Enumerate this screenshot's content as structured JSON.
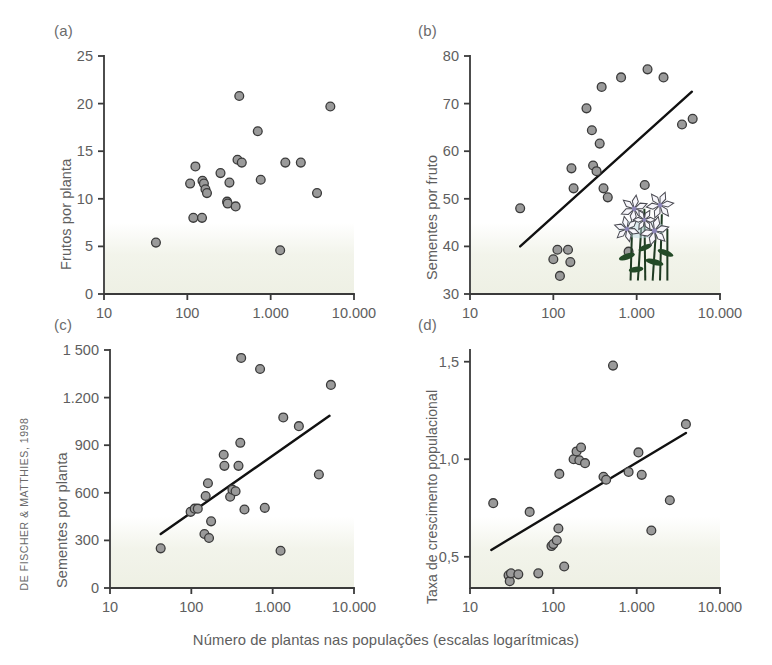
{
  "credit": "DE FISCHER & MATTHIES, 1998",
  "caption": "Número de plantas nas populações (escalas logarítmicas)",
  "shared": {
    "x_ticks": [
      "10",
      "100",
      "1.000",
      "10.000"
    ],
    "x_tick_values": [
      10,
      100,
      1000,
      10000
    ],
    "xscale": "log",
    "xlim": [
      10,
      10000
    ],
    "marker_fill": "#9a9a9a",
    "marker_stroke": "#3a3a3a",
    "axis_color": "#3a3a3a",
    "trend_color": "#111111",
    "shade_color": "#eef0e4"
  },
  "panels": [
    {
      "tag": "(a)",
      "ylabel": "Frutos por planta",
      "chart_data": {
        "type": "scatter",
        "title": "(a)",
        "xlabel": "Número de plantas nas populações (escalas logarítmicas)",
        "ylabel": "Frutos por planta",
        "xscale": "log",
        "xlim": [
          10,
          10000
        ],
        "ylim": [
          0,
          25
        ],
        "yticks": [
          0,
          5,
          10,
          15,
          20,
          25
        ],
        "ytick_labels": [
          "0",
          "5",
          "10",
          "15",
          "20",
          "25"
        ],
        "xticks": [
          10,
          100,
          1000,
          10000
        ],
        "xtick_labels": [
          "10",
          "100",
          "1.000",
          "10.000"
        ],
        "grid": false,
        "legend": null,
        "trendline": null,
        "points": [
          {
            "x": 42,
            "y": 5.4
          },
          {
            "x": 108,
            "y": 11.6
          },
          {
            "x": 118,
            "y": 8.0
          },
          {
            "x": 125,
            "y": 13.4
          },
          {
            "x": 150,
            "y": 8.0
          },
          {
            "x": 152,
            "y": 11.9
          },
          {
            "x": 158,
            "y": 11.6
          },
          {
            "x": 165,
            "y": 11.0
          },
          {
            "x": 172,
            "y": 10.6
          },
          {
            "x": 250,
            "y": 12.7
          },
          {
            "x": 300,
            "y": 9.7
          },
          {
            "x": 305,
            "y": 9.5
          },
          {
            "x": 320,
            "y": 11.7
          },
          {
            "x": 380,
            "y": 9.2
          },
          {
            "x": 400,
            "y": 14.1
          },
          {
            "x": 420,
            "y": 20.8
          },
          {
            "x": 450,
            "y": 13.8
          },
          {
            "x": 700,
            "y": 17.1
          },
          {
            "x": 760,
            "y": 12.0
          },
          {
            "x": 1300,
            "y": 4.6
          },
          {
            "x": 1500,
            "y": 13.8
          },
          {
            "x": 2300,
            "y": 13.8
          },
          {
            "x": 3600,
            "y": 10.6
          },
          {
            "x": 5200,
            "y": 19.7
          }
        ]
      }
    },
    {
      "tag": "(b)",
      "ylabel": "Sementes por fruto",
      "chart_data": {
        "type": "scatter",
        "title": "(b)",
        "xlabel": "Número de plantas nas populações (escalas logarítmicas)",
        "ylabel": "Sementes por fruto",
        "xscale": "log",
        "xlim": [
          10,
          10000
        ],
        "ylim": [
          30,
          80
        ],
        "yticks": [
          30,
          40,
          50,
          60,
          70,
          80
        ],
        "ytick_labels": [
          "30",
          "40",
          "50",
          "60",
          "70",
          "80"
        ],
        "xticks": [
          10,
          100,
          1000,
          10000
        ],
        "xtick_labels": [
          "10",
          "100",
          "1.000",
          "10.000"
        ],
        "grid": false,
        "legend": null,
        "trendline": {
          "x1": 40,
          "y1": 40.0,
          "x2": 4600,
          "y2": 72.5
        },
        "annotation": "flower-illustration",
        "points": [
          {
            "x": 40,
            "y": 48.0
          },
          {
            "x": 100,
            "y": 37.3
          },
          {
            "x": 112,
            "y": 39.3
          },
          {
            "x": 120,
            "y": 33.8
          },
          {
            "x": 150,
            "y": 39.3
          },
          {
            "x": 160,
            "y": 36.7
          },
          {
            "x": 165,
            "y": 56.4
          },
          {
            "x": 175,
            "y": 52.2
          },
          {
            "x": 250,
            "y": 69.0
          },
          {
            "x": 290,
            "y": 64.4
          },
          {
            "x": 300,
            "y": 57.0
          },
          {
            "x": 330,
            "y": 55.8
          },
          {
            "x": 360,
            "y": 61.6
          },
          {
            "x": 380,
            "y": 73.5
          },
          {
            "x": 400,
            "y": 52.2
          },
          {
            "x": 450,
            "y": 50.3
          },
          {
            "x": 650,
            "y": 75.5
          },
          {
            "x": 800,
            "y": 38.9
          },
          {
            "x": 1250,
            "y": 52.9
          },
          {
            "x": 1350,
            "y": 77.2
          },
          {
            "x": 2100,
            "y": 75.5
          },
          {
            "x": 3500,
            "y": 65.6
          },
          {
            "x": 4700,
            "y": 66.8
          }
        ]
      }
    },
    {
      "tag": "(c)",
      "ylabel": "Sementes por planta",
      "chart_data": {
        "type": "scatter",
        "title": "(c)",
        "xlabel": "Número de plantas nas populações (escalas logarítmicas)",
        "ylabel": "Sementes por planta",
        "xscale": "log",
        "xlim": [
          10,
          10000
        ],
        "ylim": [
          0,
          1500
        ],
        "yticks": [
          0,
          300,
          600,
          900,
          1200,
          1500
        ],
        "ytick_labels": [
          "0",
          "300",
          "600",
          "900",
          "1.200",
          "1 500"
        ],
        "xticks": [
          10,
          100,
          1000,
          10000
        ],
        "xtick_labels": [
          "10",
          "100",
          "1.000",
          "10.000"
        ],
        "grid": false,
        "legend": null,
        "trendline": {
          "x1": 42,
          "y1": 340,
          "x2": 5000,
          "y2": 1085
        },
        "points": [
          {
            "x": 42,
            "y": 250
          },
          {
            "x": 98,
            "y": 480
          },
          {
            "x": 110,
            "y": 500
          },
          {
            "x": 120,
            "y": 500
          },
          {
            "x": 145,
            "y": 340
          },
          {
            "x": 150,
            "y": 580
          },
          {
            "x": 160,
            "y": 660
          },
          {
            "x": 165,
            "y": 315
          },
          {
            "x": 175,
            "y": 420
          },
          {
            "x": 250,
            "y": 840
          },
          {
            "x": 255,
            "y": 770
          },
          {
            "x": 300,
            "y": 575
          },
          {
            "x": 320,
            "y": 620
          },
          {
            "x": 350,
            "y": 610
          },
          {
            "x": 380,
            "y": 770
          },
          {
            "x": 400,
            "y": 915
          },
          {
            "x": 410,
            "y": 1450
          },
          {
            "x": 450,
            "y": 495
          },
          {
            "x": 700,
            "y": 1380
          },
          {
            "x": 800,
            "y": 505
          },
          {
            "x": 1250,
            "y": 235
          },
          {
            "x": 1350,
            "y": 1075
          },
          {
            "x": 2100,
            "y": 1020
          },
          {
            "x": 3700,
            "y": 715
          },
          {
            "x": 5200,
            "y": 1280
          }
        ]
      }
    },
    {
      "tag": "(d)",
      "ylabel": "Taxa de crescimento populacional",
      "chart_data": {
        "type": "scatter",
        "title": "(d)",
        "xlabel": "Número de plantas nas populações (escalas logarítmicas)",
        "ylabel": "Taxa de crescimento populacional",
        "xscale": "log",
        "xlim": [
          10,
          10000
        ],
        "ylim": [
          0.34,
          1.56
        ],
        "yticks": [
          0.5,
          1.0,
          1.5
        ],
        "ytick_labels": [
          "0,5",
          "1,0",
          "1,5"
        ],
        "xticks": [
          10,
          100,
          1000,
          10000
        ],
        "xtick_labels": [
          "10",
          "100",
          "1.000",
          "10.000"
        ],
        "grid": false,
        "legend": null,
        "trendline": {
          "x1": 18,
          "y1": 0.535,
          "x2": 3900,
          "y2": 1.135
        },
        "points": [
          {
            "x": 19,
            "y": 0.775
          },
          {
            "x": 29,
            "y": 0.405
          },
          {
            "x": 30,
            "y": 0.375
          },
          {
            "x": 31,
            "y": 0.415
          },
          {
            "x": 38,
            "y": 0.41
          },
          {
            "x": 52,
            "y": 0.73
          },
          {
            "x": 66,
            "y": 0.415
          },
          {
            "x": 95,
            "y": 0.555
          },
          {
            "x": 100,
            "y": 0.565
          },
          {
            "x": 110,
            "y": 0.585
          },
          {
            "x": 115,
            "y": 0.645
          },
          {
            "x": 118,
            "y": 0.925
          },
          {
            "x": 135,
            "y": 0.45
          },
          {
            "x": 175,
            "y": 1.0
          },
          {
            "x": 190,
            "y": 1.04
          },
          {
            "x": 205,
            "y": 0.995
          },
          {
            "x": 215,
            "y": 1.06
          },
          {
            "x": 240,
            "y": 0.98
          },
          {
            "x": 400,
            "y": 0.91
          },
          {
            "x": 430,
            "y": 0.895
          },
          {
            "x": 520,
            "y": 1.48
          },
          {
            "x": 800,
            "y": 0.935
          },
          {
            "x": 1050,
            "y": 1.035
          },
          {
            "x": 1150,
            "y": 0.92
          },
          {
            "x": 1500,
            "y": 0.635
          },
          {
            "x": 2500,
            "y": 0.79
          },
          {
            "x": 3900,
            "y": 1.18
          }
        ]
      }
    }
  ]
}
